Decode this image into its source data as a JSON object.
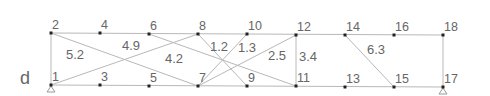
{
  "figure_label": "d",
  "colors": {
    "line": "#b8b8b8",
    "node": "#222222",
    "text": "#666666",
    "support": "#999999"
  },
  "nodes": [
    {
      "id": "1",
      "x": 51,
      "y": 85
    },
    {
      "id": "2",
      "x": 51,
      "y": 33
    },
    {
      "id": "3",
      "x": 100,
      "y": 85
    },
    {
      "id": "4",
      "x": 100,
      "y": 33
    },
    {
      "id": "5",
      "x": 149,
      "y": 86
    },
    {
      "id": "6",
      "x": 149,
      "y": 34
    },
    {
      "id": "7",
      "x": 198,
      "y": 86
    },
    {
      "id": "8",
      "x": 198,
      "y": 34
    },
    {
      "id": "9",
      "x": 247,
      "y": 86
    },
    {
      "id": "10",
      "x": 247,
      "y": 34
    },
    {
      "id": "11",
      "x": 296,
      "y": 86
    },
    {
      "id": "12",
      "x": 296,
      "y": 35
    },
    {
      "id": "13",
      "x": 345,
      "y": 87
    },
    {
      "id": "14",
      "x": 345,
      "y": 35
    },
    {
      "id": "15",
      "x": 394,
      "y": 87
    },
    {
      "id": "16",
      "x": 394,
      "y": 35
    },
    {
      "id": "17",
      "x": 443,
      "y": 87
    },
    {
      "id": "18",
      "x": 443,
      "y": 35
    }
  ],
  "edges": [
    {
      "from": "2",
      "to": "18"
    },
    {
      "from": "1",
      "to": "17"
    },
    {
      "from": "1",
      "to": "2"
    },
    {
      "from": "17",
      "to": "18"
    },
    {
      "from": "11",
      "to": "12"
    },
    {
      "from": "2",
      "to": "7"
    },
    {
      "from": "1",
      "to": "8"
    },
    {
      "from": "6",
      "to": "11"
    },
    {
      "from": "8",
      "to": "9"
    },
    {
      "from": "10",
      "to": "7"
    },
    {
      "from": "12",
      "to": "7"
    },
    {
      "from": "14",
      "to": "15"
    }
  ],
  "supports": [
    "1",
    "17"
  ],
  "edge_labels": [
    {
      "text": "5.2",
      "x": 66,
      "y": 48
    },
    {
      "text": "4.9",
      "x": 122,
      "y": 39
    },
    {
      "text": "4.2",
      "x": 165,
      "y": 52
    },
    {
      "text": "1.2",
      "x": 210,
      "y": 40
    },
    {
      "text": "1.3",
      "x": 238,
      "y": 41
    },
    {
      "text": "2.5",
      "x": 268,
      "y": 49
    },
    {
      "text": "3.4",
      "x": 299,
      "y": 50
    },
    {
      "text": "6.3",
      "x": 367,
      "y": 43
    }
  ]
}
